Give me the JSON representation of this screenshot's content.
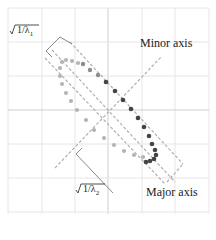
{
  "diagram": {
    "labels": {
      "minor_axis": "Minor axis",
      "major_axis": "Major axis",
      "lambda1": "√1/λ₁",
      "lambda1_inner": "1/λ",
      "lambda1_sub": "1",
      "lambda2_inner": "1/λ",
      "lambda2_sub": "2"
    },
    "colors": {
      "grid": "#e6e6e6",
      "axis_dash": "#b0b0b0",
      "bracket": "#8a8a8a",
      "ellipse_dots": "#b4b4b4",
      "path_dots": "#444444",
      "text": "#222222"
    },
    "center": [
      108,
      110
    ],
    "grid_lines_x": [
      8,
      42,
      75,
      108,
      142,
      175,
      209
    ],
    "grid_lines_y": [
      8,
      42,
      76,
      110,
      144,
      178,
      212
    ],
    "path_dots": [
      [
        105,
        80
      ],
      [
        115,
        89
      ],
      [
        123,
        98
      ],
      [
        131,
        108
      ],
      [
        138,
        117
      ],
      [
        144,
        126
      ],
      [
        149,
        135
      ],
      [
        153,
        144
      ],
      [
        156,
        151
      ],
      [
        157,
        156
      ],
      [
        155,
        160
      ],
      [
        150,
        162
      ]
    ],
    "ellipse_dots": [
      [
        62,
        62
      ],
      [
        66,
        60
      ],
      [
        72,
        61
      ],
      [
        60,
        68
      ],
      [
        61,
        76
      ],
      [
        63,
        84
      ],
      [
        67,
        93
      ],
      [
        72,
        102
      ],
      [
        79,
        112
      ],
      [
        88,
        122
      ],
      [
        97,
        132
      ],
      [
        107,
        141
      ],
      [
        118,
        150
      ],
      [
        129,
        157
      ],
      [
        140,
        161
      ]
    ]
  }
}
